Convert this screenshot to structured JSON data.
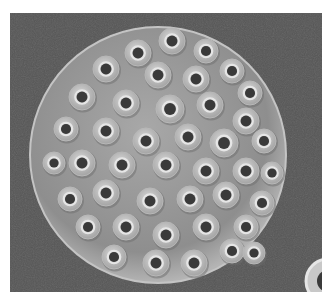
{
  "image": {
    "subject": "coccosphere",
    "description": "Grayscale scanning electron micrograph of a spherical coccolithophore covered in overlapping ring-shaped coccoliths with dark central pores",
    "colors": {
      "border": "#ffffff",
      "background": "#555555",
      "sphere_base": "#9a9a9a",
      "ring": "#c8c8c8",
      "ring_highlight": "#e6e6e6",
      "pore": "#3a3a3a"
    },
    "sphere": {
      "cx": 148,
      "cy": 142,
      "r": 128
    },
    "stray_coccolith": {
      "cx": 318,
      "cy": 268,
      "r": 22
    },
    "coccoliths": [
      [
        162,
        28,
        13
      ],
      [
        128,
        40,
        13
      ],
      [
        196,
        38,
        12
      ],
      [
        96,
        56,
        13
      ],
      [
        148,
        62,
        13
      ],
      [
        186,
        66,
        13
      ],
      [
        222,
        58,
        12
      ],
      [
        240,
        80,
        12
      ],
      [
        72,
        84,
        13
      ],
      [
        116,
        90,
        13
      ],
      [
        160,
        96,
        14
      ],
      [
        200,
        92,
        13
      ],
      [
        236,
        108,
        13
      ],
      [
        56,
        116,
        12
      ],
      [
        96,
        118,
        13
      ],
      [
        136,
        128,
        13
      ],
      [
        178,
        124,
        13
      ],
      [
        214,
        130,
        14
      ],
      [
        254,
        128,
        12
      ],
      [
        72,
        150,
        13
      ],
      [
        112,
        152,
        13
      ],
      [
        156,
        152,
        13
      ],
      [
        196,
        158,
        13
      ],
      [
        236,
        158,
        13
      ],
      [
        262,
        160,
        11
      ],
      [
        60,
        186,
        12
      ],
      [
        96,
        180,
        13
      ],
      [
        140,
        188,
        13
      ],
      [
        180,
        186,
        13
      ],
      [
        216,
        182,
        13
      ],
      [
        252,
        190,
        12
      ],
      [
        78,
        214,
        12
      ],
      [
        116,
        214,
        13
      ],
      [
        156,
        222,
        13
      ],
      [
        196,
        214,
        13
      ],
      [
        236,
        214,
        12
      ],
      [
        104,
        244,
        12
      ],
      [
        146,
        250,
        13
      ],
      [
        184,
        250,
        13
      ],
      [
        222,
        238,
        12
      ],
      [
        44,
        150,
        11
      ],
      [
        244,
        240,
        11
      ]
    ]
  }
}
